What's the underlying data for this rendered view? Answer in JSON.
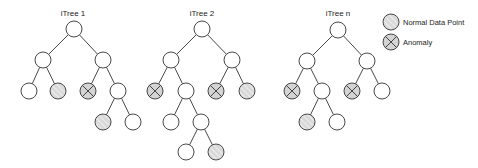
{
  "diagram": {
    "node_radius": 8,
    "colors": {
      "stroke": "#333333",
      "empty_fill": "#ffffff",
      "normal_fill": "#d9d9d9",
      "normal_stripe": "#f4f4f4",
      "anomaly_fill": "#d4d4d4"
    },
    "trees": [
      {
        "title": "iTree 1",
        "title_pos": [
          73,
          16
        ],
        "nodes": [
          {
            "id": "r",
            "x": 74,
            "y": 29,
            "type": "empty"
          },
          {
            "id": "l",
            "x": 43,
            "y": 60,
            "type": "empty"
          },
          {
            "id": "rt",
            "x": 103,
            "y": 60,
            "type": "empty"
          },
          {
            "id": "ll",
            "x": 29,
            "y": 91,
            "type": "empty"
          },
          {
            "id": "lr",
            "x": 58,
            "y": 91,
            "type": "normal"
          },
          {
            "id": "rl",
            "x": 88,
            "y": 91,
            "type": "anomaly"
          },
          {
            "id": "rr",
            "x": 118,
            "y": 91,
            "type": "empty"
          },
          {
            "id": "rrl",
            "x": 103,
            "y": 122,
            "type": "normal"
          },
          {
            "id": "rrr",
            "x": 133,
            "y": 122,
            "type": "empty"
          }
        ],
        "edges": [
          [
            "r",
            "l"
          ],
          [
            "r",
            "rt"
          ],
          [
            "l",
            "ll"
          ],
          [
            "l",
            "lr"
          ],
          [
            "rt",
            "rl"
          ],
          [
            "rt",
            "rr"
          ],
          [
            "rr",
            "rrl"
          ],
          [
            "rr",
            "rrr"
          ]
        ]
      },
      {
        "title": "iTree 2",
        "title_pos": [
          202,
          16
        ],
        "nodes": [
          {
            "id": "r",
            "x": 202,
            "y": 29,
            "type": "empty"
          },
          {
            "id": "l",
            "x": 171,
            "y": 60,
            "type": "empty"
          },
          {
            "id": "rt",
            "x": 232,
            "y": 60,
            "type": "empty"
          },
          {
            "id": "ll",
            "x": 155,
            "y": 91,
            "type": "anomaly"
          },
          {
            "id": "lr",
            "x": 186,
            "y": 91,
            "type": "empty"
          },
          {
            "id": "rl",
            "x": 216,
            "y": 91,
            "type": "anomaly"
          },
          {
            "id": "rr",
            "x": 247,
            "y": 91,
            "type": "normal"
          },
          {
            "id": "lrl",
            "x": 171,
            "y": 122,
            "type": "empty"
          },
          {
            "id": "lrr",
            "x": 201,
            "y": 122,
            "type": "empty"
          },
          {
            "id": "lrrl",
            "x": 186,
            "y": 152,
            "type": "empty"
          },
          {
            "id": "lrrr",
            "x": 216,
            "y": 152,
            "type": "normal"
          }
        ],
        "edges": [
          [
            "r",
            "l"
          ],
          [
            "r",
            "rt"
          ],
          [
            "l",
            "ll"
          ],
          [
            "l",
            "lr"
          ],
          [
            "rt",
            "rl"
          ],
          [
            "rt",
            "rr"
          ],
          [
            "lr",
            "lrl"
          ],
          [
            "lr",
            "lrr"
          ],
          [
            "lrr",
            "lrrl"
          ],
          [
            "lrr",
            "lrrr"
          ]
        ]
      },
      {
        "title": "iTree n",
        "title_pos": [
          338,
          16
        ],
        "nodes": [
          {
            "id": "r",
            "x": 338,
            "y": 30,
            "type": "empty"
          },
          {
            "id": "l",
            "x": 307,
            "y": 61,
            "type": "empty"
          },
          {
            "id": "rt",
            "x": 367,
            "y": 61,
            "type": "empty"
          },
          {
            "id": "ll",
            "x": 292,
            "y": 91,
            "type": "anomaly"
          },
          {
            "id": "lr",
            "x": 322,
            "y": 91,
            "type": "empty"
          },
          {
            "id": "rl",
            "x": 352,
            "y": 91,
            "type": "anomaly"
          },
          {
            "id": "rr",
            "x": 382,
            "y": 91,
            "type": "empty"
          },
          {
            "id": "lrl",
            "x": 307,
            "y": 122,
            "type": "normal"
          },
          {
            "id": "lrr",
            "x": 337,
            "y": 122,
            "type": "empty"
          }
        ],
        "edges": [
          [
            "r",
            "l"
          ],
          [
            "r",
            "rt"
          ],
          [
            "l",
            "ll"
          ],
          [
            "l",
            "lr"
          ],
          [
            "rt",
            "rl"
          ],
          [
            "rt",
            "rr"
          ],
          [
            "lr",
            "lrl"
          ],
          [
            "lr",
            "lrr"
          ]
        ]
      }
    ],
    "legend": [
      {
        "type": "normal",
        "label": "Normal Data Point",
        "x": 391,
        "y": 22
      },
      {
        "type": "anomaly",
        "label": "Anomaly",
        "x": 391,
        "y": 42
      }
    ]
  }
}
